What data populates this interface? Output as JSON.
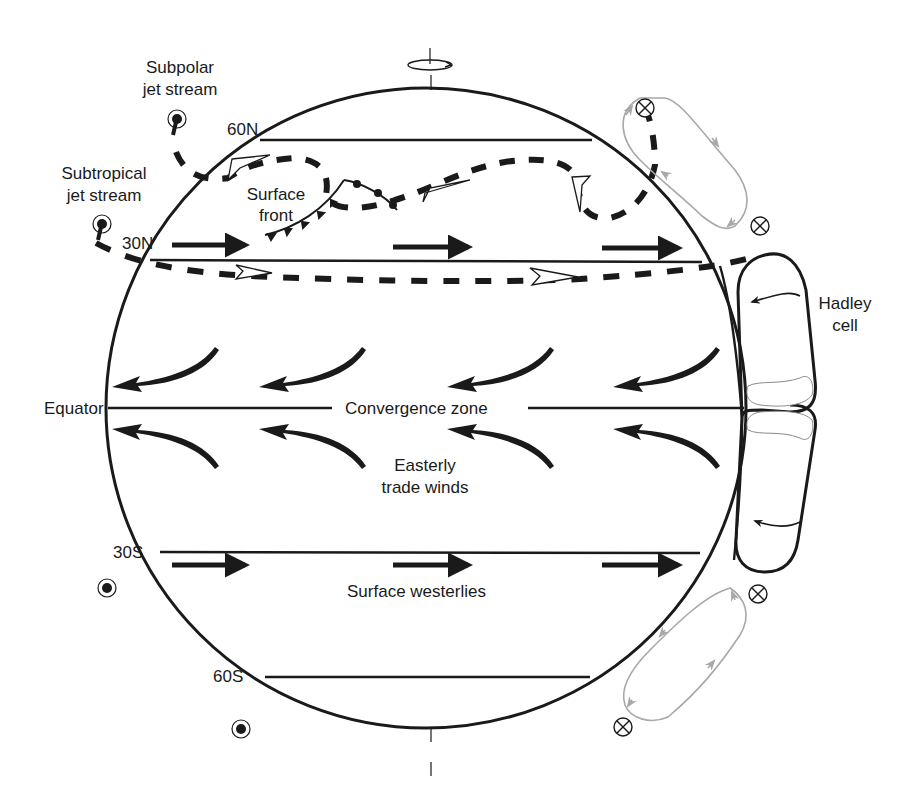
{
  "diagram": {
    "colors": {
      "ink": "#1a1a1a",
      "secondary_cell": "#a8a8a8",
      "cloud": "#8a8a8a",
      "background": "#ffffff"
    },
    "latitude_labels": {
      "n60": "60N",
      "n30": "30N",
      "equator": "Equator",
      "s30": "30S",
      "s60": "60S"
    },
    "labels": {
      "subpolar_jet": [
        "Subpolar",
        "jet stream"
      ],
      "subtropical_jet": [
        "Subtropical",
        "jet stream"
      ],
      "surface_front": [
        "Surface",
        "front"
      ],
      "convergence_zone": "Convergence zone",
      "easterly_trade_winds": [
        "Easterly",
        "trade winds"
      ],
      "surface_westerlies": "Surface westerlies",
      "hadley_cell": [
        "Hadley",
        "cell"
      ]
    },
    "symbols": {
      "out_of_page": "dot-in-circle",
      "into_page": "cross-in-circle",
      "rotation": "earth-rotation-arrow"
    }
  }
}
